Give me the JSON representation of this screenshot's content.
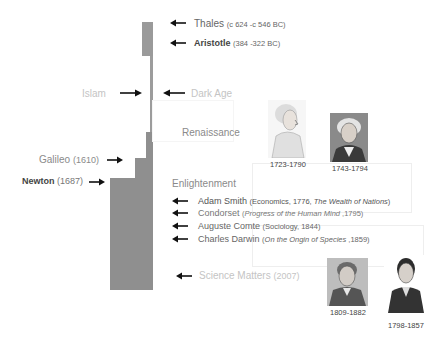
{
  "colors": {
    "bar": "#8f8f8f",
    "arrow": "#111111",
    "faint_text": "#c4c4c4",
    "text": "#555555"
  },
  "ancient": [
    {
      "name": "Thales",
      "detail": "(c 624 -c 546 BC)",
      "bold": false
    },
    {
      "name": "Aristotle",
      "detail": "(384 -322 BC)",
      "bold": true
    }
  ],
  "middle": {
    "islam": "Islam",
    "dark_age": "Dark Age",
    "renaissance": "Renaissance"
  },
  "scientific_revolution": [
    {
      "name": "Galileo",
      "detail": "(1610)",
      "bold": false
    },
    {
      "name": "Newton",
      "detail": "(1687)",
      "bold": true
    }
  ],
  "enlightenment": {
    "heading": "Enlightenment",
    "items": [
      {
        "name": "Adam Smith",
        "pre": "(Economics, 1776, ",
        "title": "The Wealth of Nations",
        "post": ")"
      },
      {
        "name": "Condorset",
        "pre": "(",
        "title": "Progress of the Human Mind",
        "post": " ,1795)"
      },
      {
        "name": "Auguste Comte",
        "pre": "(Sociology, 1844)",
        "title": "",
        "post": ""
      },
      {
        "name": "Charles Darwin",
        "pre": "(",
        "title": "On the Ongin of Species",
        "post": " ,1859)"
      }
    ]
  },
  "modern": {
    "name": "Science Matters",
    "detail": "(2007)"
  },
  "portraits": [
    {
      "id": "smith",
      "years": "1723-1790"
    },
    {
      "id": "condorcet",
      "years": "1743-1794"
    },
    {
      "id": "darwin",
      "years": "1809-1882"
    },
    {
      "id": "comte",
      "years": "1798-1857"
    }
  ]
}
